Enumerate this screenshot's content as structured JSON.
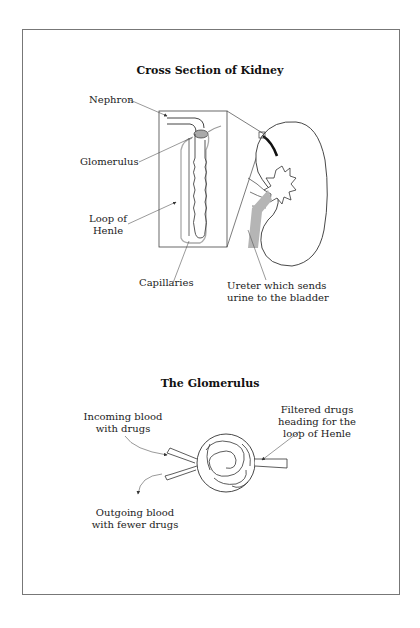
{
  "kidney_section": {
    "title": "Cross Section of Kidney",
    "labels": {
      "nephron": "Nephron",
      "glomerulus": "Glomerulus",
      "loop_of_henle_line1": "Loop of",
      "loop_of_henle_line2": "Henle",
      "capillaries": "Capillaries",
      "ureter_line1": "Ureter which sends",
      "ureter_line2": "urine to the bladder"
    }
  },
  "glomerulus_section": {
    "title": "The Glomerulus",
    "labels": {
      "incoming_line1": "Incoming blood",
      "incoming_line2": "with drugs",
      "filtered_line1": "Filtered drugs",
      "filtered_line2": "heading for the",
      "filtered_line3": "loop of Henle",
      "outgoing_line1": "Outgoing blood",
      "outgoing_line2": "with fewer drugs"
    }
  },
  "colors": {
    "line": "#333333",
    "frame": "#777777",
    "shade": "#b5b5b5",
    "dark_tube": "#111111"
  }
}
